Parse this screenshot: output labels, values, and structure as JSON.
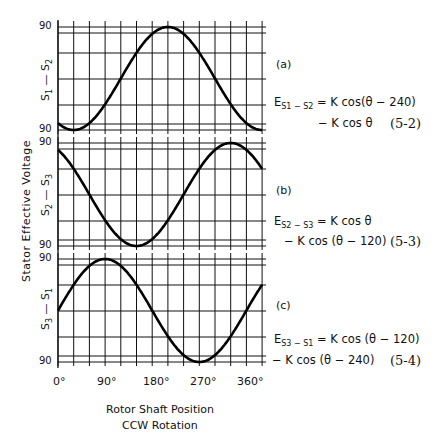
{
  "chart_data": {
    "type": "line",
    "ylabel": "Stator Effective Voltage",
    "xlabel": "Rotor Shaft Position",
    "xlabel_sub": "CCW Rotation",
    "x_ticks": [
      "0°",
      "90°",
      "180°",
      "270°",
      "360°"
    ],
    "x_range": [
      0,
      390
    ],
    "grid": true,
    "panels": [
      {
        "tag": "(a)",
        "axis_label": "S1 — S2",
        "y_top_label": "90",
        "y_bottom_label": "90",
        "formula": "E = K cos(θ − 240) − K cos θ",
        "equation_line1_lhs": "E",
        "equation_line1_sub": "S1 − S2",
        "equation_line1_rhs": "= K cos(θ − 240)",
        "equation_line2": "− K cos θ",
        "equation_number": "(5-2)",
        "phase_shift": 240,
        "series": {
          "x": [
            0,
            30,
            60,
            90,
            120,
            150,
            180,
            210,
            240,
            270,
            300,
            330,
            360
          ],
          "y": [
            -0.87,
            -1.0,
            -0.87,
            -0.5,
            0.0,
            0.5,
            0.87,
            1.0,
            0.87,
            0.5,
            0.0,
            -0.5,
            -0.87
          ]
        }
      },
      {
        "tag": "(b)",
        "axis_label": "S2 — S3",
        "y_top_label": "90",
        "y_bottom_label": "90",
        "formula": "E = K cos θ − K cos(θ − 120)",
        "equation_line1_lhs": "E",
        "equation_line1_sub": "S2 − S3",
        "equation_line1_rhs": "= K cos θ",
        "equation_line2": "− K cos (θ − 120)",
        "equation_number": "(5-3)",
        "series": {
          "x": [
            0,
            30,
            60,
            90,
            120,
            150,
            180,
            210,
            240,
            270,
            300,
            330,
            360
          ],
          "y": [
            0.87,
            0.5,
            0.0,
            -0.5,
            -0.87,
            -1.0,
            -0.87,
            -0.5,
            0.0,
            0.5,
            0.87,
            1.0,
            0.87
          ]
        }
      },
      {
        "tag": "(c)",
        "axis_label": "S3 — S1",
        "y_top_label": "90",
        "y_bottom_label": "90",
        "formula": "E = K cos(θ − 120) − K cos(θ − 240)",
        "equation_line1_lhs": "E",
        "equation_line1_sub": "S3 − S1",
        "equation_line1_rhs": "= K cos (θ − 120)",
        "equation_line2": "− K cos (θ − 240)",
        "equation_number": "(5-4)",
        "series": {
          "x": [
            0,
            30,
            60,
            90,
            120,
            150,
            180,
            210,
            240,
            270,
            300,
            330,
            360
          ],
          "y": [
            0.0,
            0.5,
            0.87,
            1.0,
            0.87,
            0.5,
            0.0,
            -0.5,
            -0.87,
            -1.0,
            -0.87,
            -0.5,
            0.0
          ]
        }
      }
    ]
  }
}
